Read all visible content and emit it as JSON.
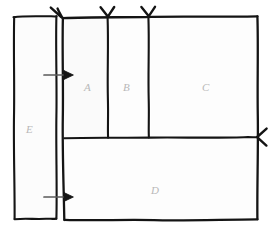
{
  "diagram": {
    "type": "hand-drawn-region-sketch",
    "title": "",
    "stroke_color": "#141414",
    "label_color": "#b8b8b8",
    "background_color": "#ffffff",
    "fill_color": "#fcfcfc",
    "regions": [
      {
        "id": "A",
        "label": "A",
        "position": "upper-row-left"
      },
      {
        "id": "B",
        "label": "B",
        "position": "upper-row-middle"
      },
      {
        "id": "C",
        "label": "C",
        "position": "upper-row-right"
      },
      {
        "id": "D",
        "label": "D",
        "position": "lower-row-full-width"
      },
      {
        "id": "E",
        "label": "E",
        "position": "left-outer-column"
      }
    ],
    "annotations": {
      "top_arrows": [
        {
          "name": "top-arrow-left",
          "direction": "down",
          "target": "main-box-left-edge"
        },
        {
          "name": "top-arrow-middle",
          "direction": "down",
          "target": "divider-a-b"
        },
        {
          "name": "top-arrow-right",
          "direction": "down",
          "target": "divider-b-c"
        }
      ],
      "side_arrows": [
        {
          "name": "left-arrow-upper",
          "direction": "right",
          "target": "main-box-left-edge"
        },
        {
          "name": "left-arrow-lower",
          "direction": "right",
          "target": "main-box-left-edge"
        }
      ],
      "right_arrow": {
        "name": "right-arrow",
        "direction": "left",
        "target": "main-box-right-edge"
      }
    }
  }
}
